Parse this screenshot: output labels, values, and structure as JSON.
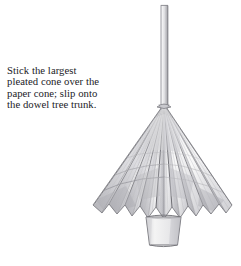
{
  "page": {
    "kind": "craft-instruction-figure",
    "background_color": "#ffffff",
    "width": 241,
    "height": 266
  },
  "caption": {
    "name": "instruction-caption",
    "text_color": "#222227",
    "lines": [
      "Stick the largest",
      "pleated cone over the",
      "paper cone; slip onto",
      "the dowel tree trunk."
    ],
    "full_text": "Stick the largest pleated cone over the paper cone; slip onto the dowel tree trunk."
  },
  "illustration": {
    "name": "pleated-cone-tree-illustration",
    "medium": "pencil-drawing",
    "subject": "pleated paper cone tree on a dowel trunk set into a pot",
    "palette": {
      "outline": "#6e6e72",
      "outline_dark": "#4a4a4e",
      "pleat_line": "#8a8a8f",
      "pleat_line_light": "#b4b4b8",
      "shade_light": "#e8e8ea",
      "shade_mid": "#d2d2d6",
      "shade_dark": "#b0b0b5",
      "paper": "#f6f6f6",
      "pot_fill": "#ededed"
    },
    "parts": [
      {
        "name": "dowel-trunk",
        "label": "dowel tree trunk",
        "top_y": 5,
        "bottom_y": 104,
        "left_x": 161,
        "right_x": 168
      },
      {
        "name": "cone-apex",
        "label": "pleated cone apex",
        "x": 164,
        "y": 104
      },
      {
        "name": "pleated-cone-skirt",
        "label": "largest pleated cone",
        "left_x": 93,
        "right_x": 232,
        "hem_y": 215,
        "pleat_count": 22
      },
      {
        "name": "pot",
        "label": "pot base",
        "top_y": 216,
        "bottom_y": 246,
        "top_left_x": 146,
        "top_right_x": 181,
        "bottom_left_x": 150,
        "bottom_right_x": 177
      }
    ]
  }
}
